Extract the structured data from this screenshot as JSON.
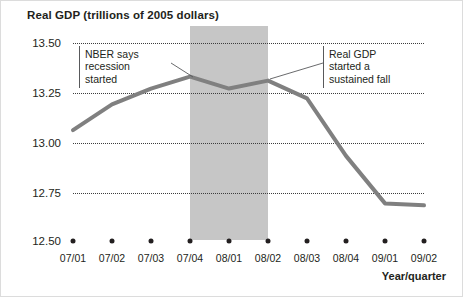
{
  "chart_data": {
    "type": "line",
    "title": "Real GDP (trillions of 2005 dollars)",
    "xlabel": "Year/quarter",
    "ylabel": "",
    "categories": [
      "07/01",
      "07/02",
      "07/03",
      "07/04",
      "08/01",
      "08/02",
      "08/03",
      "08/04",
      "09/01",
      "09/02"
    ],
    "values": [
      13.06,
      13.19,
      13.27,
      13.33,
      13.27,
      13.31,
      13.22,
      12.93,
      12.69,
      12.68
    ],
    "series": [
      {
        "name": "Real GDP",
        "values": [
          13.06,
          13.19,
          13.27,
          13.33,
          13.27,
          13.31,
          13.22,
          12.93,
          12.69,
          12.68
        ]
      }
    ],
    "ylim": [
      12.5,
      13.5
    ],
    "ytick_labels": [
      "13.50",
      "13.25",
      "13.00",
      "12.75",
      "12.50"
    ],
    "ytick_values": [
      13.5,
      13.25,
      13.0,
      12.75,
      12.5
    ],
    "grid": true,
    "grid_style": "dotted-horizontal",
    "legend": false,
    "line_color": "#808080",
    "line_width_px": 4,
    "shaded_regions": [
      {
        "label": "recession",
        "from": "07/04",
        "to": "08/02",
        "color": "#c6c6c6"
      }
    ],
    "annotations": [
      {
        "id": "nber",
        "lines": [
          "NBER says",
          "recession",
          "started"
        ],
        "points_to": "07/04"
      },
      {
        "id": "sustained-fall",
        "lines": [
          "Real GDP",
          "started a",
          "sustained fall"
        ],
        "points_to": "08/02"
      }
    ]
  },
  "axis": {
    "x_title": "Year/quarter"
  }
}
